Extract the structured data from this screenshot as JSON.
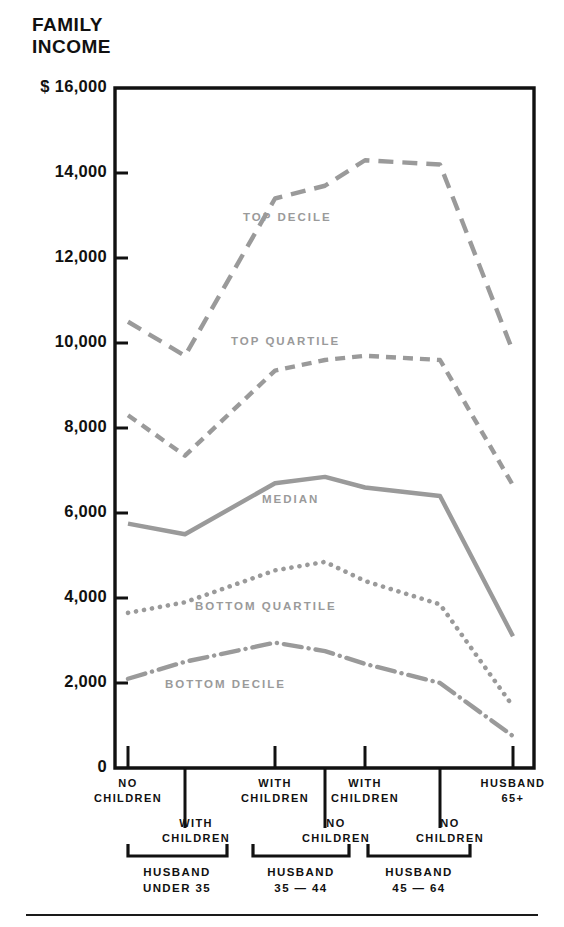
{
  "title": "FAMILY\nINCOME",
  "colors": {
    "series": "#9a9a9a",
    "axis": "#111111",
    "text": "#111111"
  },
  "axis": {
    "y_ticks": [
      "$ 16,000",
      "14,000",
      "12,000",
      "10,000",
      "8,000",
      "6,000",
      "4,000",
      "2,000",
      "0"
    ],
    "y_values": [
      16000,
      14000,
      12000,
      10000,
      8000,
      6000,
      4000,
      2000,
      0
    ]
  },
  "categories": [
    {
      "label": "NO\nCHILDREN",
      "row": "upper"
    },
    {
      "label": "WITH\nCHILDREN",
      "row": "lower"
    },
    {
      "label": "WITH\nCHILDREN",
      "row": "upper"
    },
    {
      "label": "NO\nCHILDREN",
      "row": "lower"
    },
    {
      "label": "WITH\nCHILDREN",
      "row": "upper"
    },
    {
      "label": "NO\nCHILDREN",
      "row": "lower"
    },
    {
      "label": "HUSBAND\n65+",
      "row": "upper"
    }
  ],
  "groups": [
    {
      "label": "HUSBAND\nUNDER 35"
    },
    {
      "label": "HUSBAND\n35 — 44"
    },
    {
      "label": "HUSBAND\n45 — 64"
    }
  ],
  "series_labels": {
    "top_decile": "TOP DECILE",
    "top_quartile": "TOP QUARTILE",
    "median": "MEDIAN",
    "bottom_quartile": "BOTTOM QUARTILE",
    "bottom_decile": "BOTTOM DECILE"
  },
  "chart_data": {
    "type": "line",
    "title": "FAMILY INCOME",
    "xlabel": "",
    "ylabel": "FAMILY INCOME",
    "ylim": [
      0,
      16000
    ],
    "yticks": [
      0,
      2000,
      4000,
      6000,
      8000,
      10000,
      12000,
      14000,
      16000
    ],
    "grid": false,
    "legend": "inline-labels",
    "categories": [
      "HUSBAND UNDER 35 / NO CHILDREN",
      "HUSBAND UNDER 35 / WITH CHILDREN",
      "HUSBAND 35-44 / WITH CHILDREN",
      "HUSBAND 35-44 / NO CHILDREN",
      "HUSBAND 45-64 / WITH CHILDREN",
      "HUSBAND 45-64 / NO CHILDREN",
      "HUSBAND 65+"
    ],
    "series": [
      {
        "name": "TOP DECILE",
        "style": "long-dash",
        "values": [
          10500,
          9700,
          13400,
          13700,
          14300,
          14200,
          9800
        ]
      },
      {
        "name": "TOP QUARTILE",
        "style": "dashed",
        "values": [
          8300,
          7350,
          9350,
          9600,
          9700,
          9600,
          6650
        ]
      },
      {
        "name": "MEDIAN",
        "style": "solid",
        "values": [
          5750,
          5500,
          6700,
          6850,
          6600,
          6400,
          3100
        ]
      },
      {
        "name": "BOTTOM QUARTILE",
        "style": "dotted",
        "values": [
          3650,
          3900,
          4650,
          4850,
          4400,
          3850,
          1450
        ]
      },
      {
        "name": "BOTTOM DECILE",
        "style": "dash-dot",
        "values": [
          2100,
          2500,
          2950,
          2750,
          2450,
          2000,
          750
        ]
      }
    ]
  }
}
